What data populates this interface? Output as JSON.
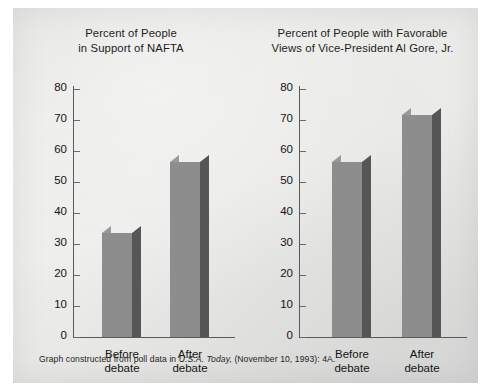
{
  "figure": {
    "source_note_prefix": "Graph constructed from poll data in ",
    "source_note_italic": "U.S.A. Today,",
    "source_note_suffix": " (November 10, 1993): 4A."
  },
  "colors": {
    "bar_front": "#8d8d8d",
    "bar_side": "#565656",
    "bar_top": "#9a9a9a",
    "axis": "#5a5a5a",
    "panel_background": "#eaeae8",
    "text": "#141414"
  },
  "chart_data": [
    {
      "type": "bar",
      "title": "Percent of People\nin Support of NAFTA",
      "title_line1": "Percent of People",
      "title_line2": "in Support of NAFTA",
      "categories": [
        "Before debate",
        "After debate"
      ],
      "category_labels": [
        "Before\ndebate",
        "After\ndebate"
      ],
      "values": [
        33.5,
        56.5
      ],
      "xlabel": "",
      "ylabel": "",
      "ylim": [
        0,
        80
      ],
      "yticks": [
        0,
        10,
        20,
        30,
        40,
        50,
        60,
        70,
        80
      ],
      "ytick_labels": [
        "0",
        "10",
        "20",
        "30",
        "40",
        "50",
        "60",
        "70",
        "80"
      ],
      "grid": false,
      "legend": false
    },
    {
      "type": "bar",
      "title": "Percent of People with Favorable\nViews of Vice-President Al Gore, Jr.",
      "title_line1": "Percent of People with Favorable",
      "title_line2": "Views of Vice-President Al Gore, Jr.",
      "categories": [
        "Before debate",
        "After debate"
      ],
      "category_labels": [
        "Before\ndebate",
        "After\ndebate"
      ],
      "values": [
        56.5,
        71.5
      ],
      "xlabel": "",
      "ylabel": "",
      "ylim": [
        0,
        80
      ],
      "yticks": [
        0,
        10,
        20,
        30,
        40,
        50,
        60,
        70,
        80
      ],
      "ytick_labels": [
        "0",
        "10",
        "20",
        "30",
        "40",
        "50",
        "60",
        "70",
        "80"
      ],
      "grid": false,
      "legend": false
    }
  ]
}
